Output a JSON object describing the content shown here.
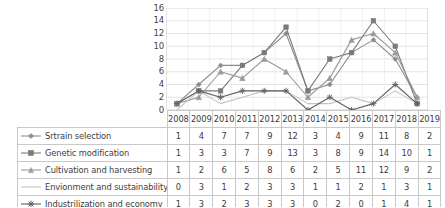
{
  "chart_data": {
    "type": "line",
    "title": "",
    "xlabel": "",
    "ylabel": "",
    "ylim": [
      0,
      16
    ],
    "ytick_step": 2,
    "grid": true,
    "legend_position": "table-left",
    "categories": [
      "2008",
      "2009",
      "2010",
      "2011",
      "2012",
      "2013",
      "2014",
      "2015",
      "2016",
      "2017",
      "2018",
      "2019"
    ],
    "yticks": [
      "16",
      "14",
      "12",
      "10",
      "8",
      "6",
      "4",
      "2",
      "0"
    ],
    "series": [
      {
        "name": "Srtrain selection",
        "marker": "diamond",
        "color": "#8c8c8c",
        "values": [
          1,
          4,
          7,
          7,
          9,
          12,
          3,
          4,
          9,
          11,
          8,
          2
        ]
      },
      {
        "name": "Genetic modification",
        "marker": "square",
        "color": "#7a7a7a",
        "values": [
          1,
          3,
          3,
          7,
          9,
          13,
          3,
          8,
          9,
          14,
          10,
          1
        ]
      },
      {
        "name": "Cultivation and harvesting",
        "marker": "triangle",
        "color": "#9a9a9a",
        "values": [
          1,
          2,
          6,
          5,
          8,
          6,
          2,
          5,
          11,
          12,
          9,
          2
        ]
      },
      {
        "name": "Envionment and sustainability",
        "marker": "none",
        "color": "#c4c4c4",
        "values": [
          0,
          3,
          1,
          2,
          3,
          3,
          1,
          1,
          2,
          1,
          3,
          1
        ]
      },
      {
        "name": "Industrilization and economy",
        "marker": "asterisk",
        "color": "#606060",
        "values": [
          1,
          3,
          2,
          3,
          3,
          3,
          0,
          2,
          0,
          1,
          4,
          1
        ]
      }
    ]
  },
  "table": {
    "year_header": [
      "2008",
      "2009",
      "2010",
      "2011",
      "2012",
      "2013",
      "2014",
      "2015",
      "2016",
      "2017",
      "2018",
      "2019"
    ],
    "rows": [
      {
        "label": "Srtrain selection",
        "values": [
          "1",
          "4",
          "7",
          "7",
          "9",
          "12",
          "3",
          "4",
          "9",
          "11",
          "8",
          "2"
        ]
      },
      {
        "label": "Genetic modification",
        "values": [
          "1",
          "3",
          "3",
          "7",
          "9",
          "13",
          "3",
          "8",
          "9",
          "14",
          "10",
          "1"
        ]
      },
      {
        "label": "Cultivation and harvesting",
        "values": [
          "1",
          "2",
          "6",
          "5",
          "8",
          "6",
          "2",
          "5",
          "11",
          "12",
          "9",
          "2"
        ]
      },
      {
        "label": "Envionment and sustainability",
        "values": [
          "0",
          "3",
          "1",
          "2",
          "3",
          "3",
          "1",
          "1",
          "2",
          "1",
          "3",
          "1"
        ]
      },
      {
        "label": "Industrilization and economy",
        "values": [
          "1",
          "3",
          "2",
          "3",
          "3",
          "3",
          "0",
          "2",
          "0",
          "1",
          "4",
          "1"
        ]
      }
    ]
  },
  "colors": {
    "grid": "#d9d9d9",
    "axis": "#bfbfbf",
    "border": "#c9c9c9",
    "text": "#3c3c3c"
  }
}
